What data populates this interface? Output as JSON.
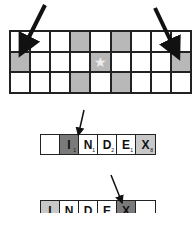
{
  "grid": {
    "rows": 3,
    "cols": 9,
    "cells": [
      [
        {
          "shaded": false
        },
        {
          "shaded": false
        },
        {
          "shaded": false
        },
        {
          "shaded": true
        },
        {
          "shaded": false
        },
        {
          "shaded": true
        },
        {
          "shaded": false
        },
        {
          "shaded": false
        },
        {
          "shaded": false
        }
      ],
      [
        {
          "shaded": true
        },
        {
          "shaded": false
        },
        {
          "shaded": false
        },
        {
          "shaded": false
        },
        {
          "shaded": true,
          "icon": "★"
        },
        {
          "shaded": false
        },
        {
          "shaded": false
        },
        {
          "shaded": false
        },
        {
          "shaded": true
        }
      ],
      [
        {
          "shaded": false
        },
        {
          "shaded": false
        },
        {
          "shaded": false
        },
        {
          "shaded": true
        },
        {
          "shaded": false
        },
        {
          "shaded": true
        },
        {
          "shaded": false
        },
        {
          "shaded": false
        },
        {
          "shaded": false
        }
      ]
    ]
  },
  "word_row_1": {
    "tiles": [
      {
        "letter": "",
        "points": "",
        "shade": "none"
      },
      {
        "letter": "I",
        "points": "1",
        "shade": "dark"
      },
      {
        "letter": "N",
        "points": "1",
        "shade": "none"
      },
      {
        "letter": "D",
        "points": "2",
        "shade": "none"
      },
      {
        "letter": "E",
        "points": "1",
        "shade": "none"
      },
      {
        "letter": "X",
        "points": "8",
        "shade": "light"
      }
    ]
  },
  "word_row_2": {
    "tiles": [
      {
        "letter": "I",
        "points": "",
        "shade": "light"
      },
      {
        "letter": "N",
        "points": "",
        "shade": "none"
      },
      {
        "letter": "D",
        "points": "",
        "shade": "none"
      },
      {
        "letter": "E",
        "points": "",
        "shade": "none"
      },
      {
        "letter": "X",
        "points": "",
        "shade": "dark"
      },
      {
        "letter": "",
        "points": "",
        "shade": "none"
      }
    ]
  },
  "colors": {
    "shaded": "#b8b8b8",
    "dark_tile": "#7a7a7a",
    "light_tile": "#c8c8c8",
    "line": "#222222"
  }
}
